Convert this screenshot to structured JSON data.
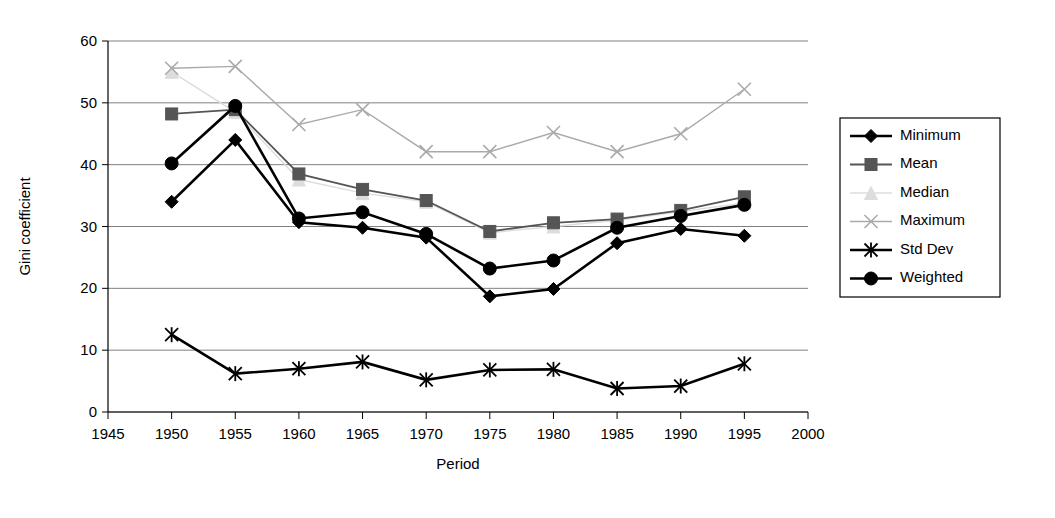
{
  "chart_data": {
    "type": "line",
    "title": "",
    "xlabel": "Period",
    "ylabel": "Gini coefficient",
    "x": [
      1950,
      1955,
      1960,
      1965,
      1970,
      1975,
      1980,
      1985,
      1990,
      1995
    ],
    "xlim": [
      1945,
      2000
    ],
    "ylim": [
      0,
      60
    ],
    "xticks": [
      "1945",
      "1950",
      "1955",
      "1960",
      "1965",
      "1970",
      "1975",
      "1980",
      "1985",
      "1990",
      "1995",
      "2000"
    ],
    "yticks": [
      "0",
      "10",
      "20",
      "30",
      "40",
      "50",
      "60"
    ],
    "grid": true,
    "legend_position": "right",
    "series": [
      {
        "name": "Minimum",
        "marker": "diamond",
        "color": "#000000",
        "values": [
          34.0,
          44.0,
          30.7,
          29.8,
          28.2,
          18.7,
          19.9,
          27.3,
          29.6,
          28.5
        ]
      },
      {
        "name": "Mean",
        "marker": "square",
        "color": "#555555",
        "values": [
          48.2,
          48.9,
          38.5,
          36.0,
          34.2,
          29.2,
          30.6,
          31.2,
          32.6,
          34.8
        ]
      },
      {
        "name": "Median",
        "marker": "triangle",
        "color": "#dddddd",
        "values": [
          55.0,
          48.5,
          37.6,
          35.4,
          34.0,
          29.0,
          30.0,
          31.0,
          32.4,
          33.8
        ]
      },
      {
        "name": "Maximum",
        "marker": "x",
        "color": "#aaaaaa",
        "values": [
          55.6,
          55.9,
          46.5,
          48.9,
          42.1,
          42.1,
          45.2,
          42.1,
          45.0,
          52.2
        ]
      },
      {
        "name": "Std Dev",
        "marker": "asterisk",
        "color": "#000000",
        "values": [
          12.5,
          6.2,
          7.0,
          8.1,
          5.2,
          6.8,
          6.9,
          3.8,
          4.2,
          7.8
        ]
      },
      {
        "name": "Weighted",
        "marker": "circle",
        "color": "#000000",
        "values": [
          40.2,
          49.5,
          31.3,
          32.3,
          28.8,
          23.2,
          24.5,
          29.8,
          31.7,
          33.5
        ]
      }
    ]
  }
}
